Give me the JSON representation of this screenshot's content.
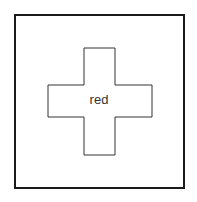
{
  "diagram": {
    "frame": {
      "stroke": "#1a1a1a"
    },
    "shape": {
      "type": "cross",
      "stroke": "#333333",
      "fill": "#ffffff",
      "label": "red"
    }
  }
}
